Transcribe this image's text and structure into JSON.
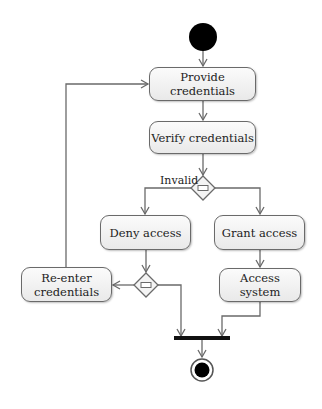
{
  "diagram": {
    "type": "UML activity diagram",
    "nodes": {
      "provide": {
        "label": "Provide credentials"
      },
      "verify": {
        "label": "Verify credentials"
      },
      "deny": {
        "label": "Deny access"
      },
      "grant": {
        "label": "Grant access"
      },
      "access": {
        "label": "Access system"
      },
      "reenter": {
        "label": "Re-enter credentials"
      }
    },
    "guards": {
      "invalid": "Invalid"
    },
    "colors": {
      "line": "#6a6a6a",
      "node_fill": "#f2f2f2",
      "initial": "#000000"
    }
  }
}
